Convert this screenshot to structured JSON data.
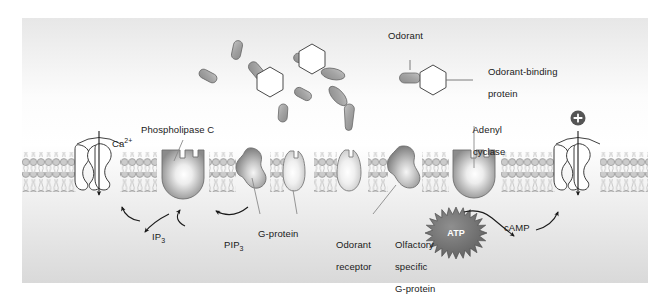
{
  "figure": {
    "background_color": "#ffffff",
    "panel_gradient_top": "#e9e9e9",
    "panel_gradient_mid": "#fbfbfb",
    "panel_gradient_bottom": "#dcdcdc"
  },
  "legend": {
    "odorant_label": "Odorant",
    "binding_protein_label_line1": "Odorant-binding",
    "binding_protein_label_line2": "protein"
  },
  "labels": {
    "calcium": "Ca",
    "calcium_sup": "2+",
    "phospholipase_c": "Phospholipase C",
    "ip3": "IP",
    "ip3_sub": "3",
    "pip3": "PIP",
    "pip3_sub": "3",
    "g_protein": "G-protein",
    "odorant_receptor_line1": "Odorant",
    "odorant_receptor_line2": "receptor",
    "olfactory_g_line1": "Olfactory",
    "olfactory_g_line2": "specific",
    "olfactory_g_line3": "G-protein",
    "adenyl_cyclase_line1": "Adenyl",
    "adenyl_cyclase_line2": "cyclase",
    "atp": "ATP",
    "camp": "cAMP",
    "cation_plus": "+"
  },
  "colors": {
    "membrane_head_fill": "#c9c9c9",
    "membrane_head_stroke": "#8a8a8a",
    "membrane_tail": "#b8b8b8",
    "protein_dark": "#8e8e8e",
    "protein_light": "#f2f2f2",
    "protein_stroke": "#6f6f6f",
    "odorant_fill": "#a8a8a8",
    "odorant_stroke": "#6a6a6a",
    "hexagon_fill": "#ffffff",
    "hexagon_stroke": "#4a4a4a",
    "atp_fill": "#6e6e6e",
    "atp_text": "#ffffff",
    "plus_badge_fill": "#555555",
    "channel_fill": "#ffffff",
    "channel_stroke": "#3a3a3a",
    "arrow_color": "#1a1a1a",
    "leader_color": "#808080",
    "text_color": "#1a1a1a"
  },
  "membrane": {
    "top_y": 134,
    "bottom_y": 174,
    "bilayer_description": "phospholipid bilayer with circular head groups and wavy hydrophobic tails"
  },
  "odorants": [
    {
      "name": "odorant-1",
      "x": 215,
      "y": 32,
      "angle": 78,
      "w": 9,
      "h": 19
    },
    {
      "name": "odorant-2",
      "x": 186,
      "y": 58,
      "angle": 28,
      "w": 9,
      "h": 19
    },
    {
      "name": "odorant-3",
      "x": 235,
      "y": 53,
      "angle": 42,
      "w": 10,
      "h": 21
    },
    {
      "name": "odorant-4",
      "x": 281,
      "y": 41,
      "angle": 70,
      "w": 9,
      "h": 19
    },
    {
      "name": "odorant-5",
      "x": 307,
      "y": 55,
      "angle": 108,
      "w": 10,
      "h": 23
    },
    {
      "name": "odorant-6",
      "x": 281,
      "y": 76,
      "angle": 28,
      "w": 9,
      "h": 18
    },
    {
      "name": "odorant-7",
      "x": 316,
      "y": 78,
      "angle": 48,
      "w": 10,
      "h": 23
    },
    {
      "name": "odorant-8",
      "x": 261,
      "y": 95,
      "angle": 88,
      "w": 9,
      "h": 18
    },
    {
      "name": "odorant-9",
      "x": 327,
      "y": 100,
      "angle": 88,
      "w": 10,
      "h": 24
    }
  ],
  "binding_proteins": [
    {
      "name": "binding-protein-1",
      "x": 248,
      "y": 64,
      "r": 15
    },
    {
      "name": "binding-protein-2",
      "x": 290,
      "y": 41,
      "r": 15
    }
  ],
  "proteins": [
    {
      "name": "calcium-channel",
      "kind": "channel",
      "cx": 75,
      "label": "Ca2+"
    },
    {
      "name": "phospholipase-c",
      "kind": "blob-knob",
      "cx": 160,
      "label": "Phospholipase C"
    },
    {
      "name": "g-protein",
      "kind": "irregular-blob",
      "cx": 230,
      "label": "G-protein"
    },
    {
      "name": "odorant-receptor-1",
      "kind": "oval-notch",
      "cx": 277,
      "label": "Odorant receptor"
    },
    {
      "name": "odorant-receptor-2",
      "kind": "oval-notch",
      "cx": 330,
      "label": "Odorant receptor"
    },
    {
      "name": "olfactory-specific-g-protein",
      "kind": "irregular-blob",
      "cx": 382,
      "label": "Olfactory specific G-protein"
    },
    {
      "name": "adenyl-cyclase",
      "kind": "blob-knob",
      "cx": 452,
      "label": "Adenyl cyclase"
    },
    {
      "name": "cation-channel",
      "kind": "channel",
      "cx": 555,
      "label": "+"
    }
  ]
}
